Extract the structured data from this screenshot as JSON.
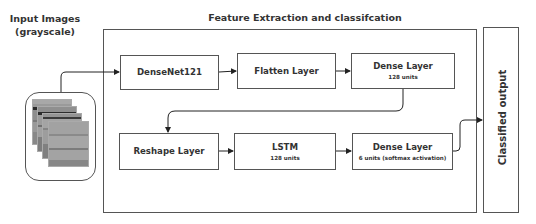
{
  "input": {
    "title_line1": "Input Images",
    "title_line2": "(grayscale)",
    "image_count": 4
  },
  "feature_block": {
    "title": "Feature Extraction and classifcation"
  },
  "nodes": {
    "densenet": {
      "title": "DenseNet121",
      "sub": ""
    },
    "flatten": {
      "title": "Flatten Layer",
      "sub": ""
    },
    "dense1": {
      "title": "Dense Layer",
      "sub": "128 units"
    },
    "reshape": {
      "title": "Reshape Layer",
      "sub": ""
    },
    "lstm": {
      "title": "LSTM",
      "sub": "128 units"
    },
    "dense2": {
      "title": "Dense Layer",
      "sub": "6 units (softmax activation)"
    }
  },
  "output": {
    "label": "Classified output"
  },
  "colors": {
    "stroke": "#555555",
    "arrow": "#222222",
    "text": "#333333",
    "background": "#ffffff"
  }
}
